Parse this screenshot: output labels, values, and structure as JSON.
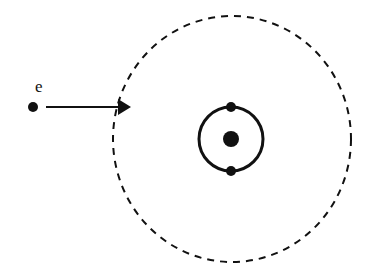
{
  "diagram": {
    "incident_electron_label": "e",
    "colors": {
      "ink": "#111111",
      "background": "#ffffff"
    }
  }
}
